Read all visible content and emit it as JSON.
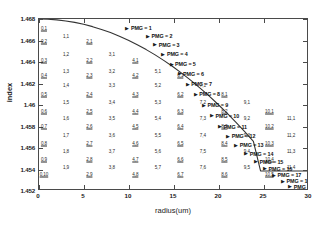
{
  "chart_data": {
    "type": "line",
    "title": "",
    "xlabel": "radius(um)",
    "ylabel": "index",
    "xlim": [
      0,
      30
    ],
    "ylim": [
      1.452,
      1.468
    ],
    "xticks": [
      "0",
      "5",
      "10",
      "15",
      "20",
      "25",
      "30"
    ],
    "xtick_values": [
      0,
      5,
      10,
      15,
      20,
      25,
      30
    ],
    "yticks": [
      "1.468",
      "1.466",
      "1.464",
      "1.462",
      "1.46",
      "1.458",
      "1.456",
      "1.454",
      "1.452"
    ],
    "ytick_values": [
      1.468,
      1.466,
      1.464,
      1.462,
      1.46,
      1.458,
      1.456,
      1.454,
      1.452
    ],
    "grid": false,
    "legend": "none",
    "series": [
      {
        "name": "refractive index profile",
        "color": "#333333",
        "x": [
          0,
          1,
          2,
          3,
          4,
          5,
          6,
          7,
          8,
          9,
          10,
          11,
          12,
          13,
          14,
          15,
          16,
          17,
          18,
          19,
          20,
          21,
          22,
          23,
          24,
          24.8,
          25,
          26,
          27,
          28,
          29,
          30
        ],
        "y": [
          1.468,
          1.46798,
          1.46792,
          1.46782,
          1.46768,
          1.4675,
          1.46728,
          1.46702,
          1.46672,
          1.46638,
          1.466,
          1.46558,
          1.46512,
          1.46462,
          1.46408,
          1.4635,
          1.46288,
          1.46222,
          1.46152,
          1.46078,
          1.46,
          1.45918,
          1.45832,
          1.45742,
          1.45648,
          1.4537,
          1.4537,
          1.4537,
          1.4537,
          1.4537,
          1.4537,
          1.4537
        ]
      }
    ],
    "mode_labels": [
      {
        "text": "0,1",
        "x": 0.55,
        "y": 1.46715,
        "underline": true
      },
      {
        "text": "0,2",
        "x": 0.55,
        "y": 1.46595,
        "underline": true
      },
      {
        "text": "0,3",
        "x": 0.55,
        "y": 1.46415,
        "underline": true
      },
      {
        "text": "0,4",
        "x": 0.55,
        "y": 1.46275,
        "underline": true
      },
      {
        "text": "0,5",
        "x": 0.55,
        "y": 1.46105,
        "underline": true
      },
      {
        "text": "0,6",
        "x": 0.55,
        "y": 1.45945,
        "underline": true
      },
      {
        "text": "0,7",
        "x": 0.55,
        "y": 1.45805,
        "underline": true
      },
      {
        "text": "0,8",
        "x": 0.55,
        "y": 1.4565,
        "underline": true
      },
      {
        "text": "0,9",
        "x": 0.55,
        "y": 1.45495,
        "underline": true
      },
      {
        "text": "0,10",
        "x": 0.55,
        "y": 1.45355,
        "underline": true
      },
      {
        "text": "1,1",
        "x": 3.0,
        "y": 1.4664,
        "underline": false
      },
      {
        "text": "1,2",
        "x": 3.0,
        "y": 1.4647,
        "underline": false
      },
      {
        "text": "1,3",
        "x": 3.0,
        "y": 1.4632,
        "underline": false
      },
      {
        "text": "1,4",
        "x": 3.0,
        "y": 1.46185,
        "underline": false
      },
      {
        "text": "1,5",
        "x": 3.0,
        "y": 1.4603,
        "underline": false
      },
      {
        "text": "1,6",
        "x": 3.0,
        "y": 1.45875,
        "underline": false
      },
      {
        "text": "1,7",
        "x": 3.0,
        "y": 1.4572,
        "underline": false
      },
      {
        "text": "1,8",
        "x": 3.0,
        "y": 1.4557,
        "underline": false
      },
      {
        "text": "1,9",
        "x": 3.0,
        "y": 1.4542,
        "underline": false
      },
      {
        "text": "2,1",
        "x": 5.6,
        "y": 1.46595,
        "underline": true
      },
      {
        "text": "2,2",
        "x": 5.6,
        "y": 1.46415,
        "underline": true
      },
      {
        "text": "2,3",
        "x": 5.6,
        "y": 1.46275,
        "underline": true
      },
      {
        "text": "2,4",
        "x": 5.6,
        "y": 1.46105,
        "underline": true
      },
      {
        "text": "2,5",
        "x": 5.6,
        "y": 1.45945,
        "underline": true
      },
      {
        "text": "2,6",
        "x": 5.6,
        "y": 1.45805,
        "underline": true
      },
      {
        "text": "2,7",
        "x": 5.6,
        "y": 1.4565,
        "underline": true
      },
      {
        "text": "2,8",
        "x": 5.6,
        "y": 1.45495,
        "underline": true
      },
      {
        "text": "2,9",
        "x": 5.6,
        "y": 1.45355,
        "underline": true
      },
      {
        "text": "3,1",
        "x": 8.1,
        "y": 1.4647,
        "underline": false
      },
      {
        "text": "3,2",
        "x": 8.1,
        "y": 1.4632,
        "underline": false
      },
      {
        "text": "3,3",
        "x": 8.1,
        "y": 1.46185,
        "underline": false
      },
      {
        "text": "3,4",
        "x": 8.1,
        "y": 1.4603,
        "underline": false
      },
      {
        "text": "3,5",
        "x": 8.1,
        "y": 1.45875,
        "underline": false
      },
      {
        "text": "3,6",
        "x": 8.1,
        "y": 1.4572,
        "underline": false
      },
      {
        "text": "3,7",
        "x": 8.1,
        "y": 1.4557,
        "underline": false
      },
      {
        "text": "3,8",
        "x": 8.1,
        "y": 1.4542,
        "underline": false
      },
      {
        "text": "4,1",
        "x": 10.7,
        "y": 1.46415,
        "underline": true
      },
      {
        "text": "4,2",
        "x": 10.7,
        "y": 1.46275,
        "underline": true
      },
      {
        "text": "4,3",
        "x": 10.7,
        "y": 1.46105,
        "underline": true
      },
      {
        "text": "4,4",
        "x": 10.7,
        "y": 1.45945,
        "underline": true
      },
      {
        "text": "4,5",
        "x": 10.7,
        "y": 1.45805,
        "underline": true
      },
      {
        "text": "4,6",
        "x": 10.7,
        "y": 1.4565,
        "underline": true
      },
      {
        "text": "4,7",
        "x": 10.7,
        "y": 1.45495,
        "underline": true
      },
      {
        "text": "4,8",
        "x": 10.7,
        "y": 1.45355,
        "underline": true
      },
      {
        "text": "5,1",
        "x": 13.2,
        "y": 1.4632,
        "underline": false
      },
      {
        "text": "5,2",
        "x": 13.2,
        "y": 1.46185,
        "underline": false
      },
      {
        "text": "5,3",
        "x": 13.2,
        "y": 1.4603,
        "underline": false
      },
      {
        "text": "5,4",
        "x": 13.2,
        "y": 1.45875,
        "underline": false
      },
      {
        "text": "5,5",
        "x": 13.2,
        "y": 1.4572,
        "underline": false
      },
      {
        "text": "5,6",
        "x": 13.2,
        "y": 1.4557,
        "underline": false
      },
      {
        "text": "5,7",
        "x": 13.2,
        "y": 1.4542,
        "underline": false
      },
      {
        "text": "6,1",
        "x": 15.7,
        "y": 1.46275,
        "underline": true
      },
      {
        "text": "6,2",
        "x": 15.7,
        "y": 1.46105,
        "underline": true
      },
      {
        "text": "6,3",
        "x": 15.7,
        "y": 1.45945,
        "underline": true
      },
      {
        "text": "6,4",
        "x": 15.7,
        "y": 1.45805,
        "underline": true
      },
      {
        "text": "6,5",
        "x": 15.7,
        "y": 1.4565,
        "underline": true
      },
      {
        "text": "6,6",
        "x": 15.7,
        "y": 1.45495,
        "underline": true
      },
      {
        "text": "6,7",
        "x": 15.7,
        "y": 1.45355,
        "underline": true
      },
      {
        "text": "7,1",
        "x": 18.2,
        "y": 1.46185,
        "underline": false
      },
      {
        "text": "7,2",
        "x": 18.2,
        "y": 1.4603,
        "underline": false
      },
      {
        "text": "7,3",
        "x": 18.2,
        "y": 1.45875,
        "underline": false
      },
      {
        "text": "7,4",
        "x": 18.2,
        "y": 1.4572,
        "underline": false
      },
      {
        "text": "7,5",
        "x": 18.2,
        "y": 1.4557,
        "underline": false
      },
      {
        "text": "7,6",
        "x": 18.2,
        "y": 1.4542,
        "underline": false
      },
      {
        "text": "8,1",
        "x": 20.6,
        "y": 1.46105,
        "underline": true
      },
      {
        "text": "8,2",
        "x": 20.6,
        "y": 1.45945,
        "underline": true
      },
      {
        "text": "8,3",
        "x": 20.6,
        "y": 1.45805,
        "underline": true
      },
      {
        "text": "8,4",
        "x": 20.6,
        "y": 1.4565,
        "underline": true
      },
      {
        "text": "8,5",
        "x": 20.6,
        "y": 1.45495,
        "underline": true
      },
      {
        "text": "8,6",
        "x": 20.6,
        "y": 1.45355,
        "underline": true
      },
      {
        "text": "9,1",
        "x": 23.1,
        "y": 1.4603,
        "underline": false
      },
      {
        "text": "9,2",
        "x": 23.1,
        "y": 1.45875,
        "underline": false
      },
      {
        "text": "9,3",
        "x": 23.1,
        "y": 1.4572,
        "underline": false
      },
      {
        "text": "9,4",
        "x": 23.1,
        "y": 1.4557,
        "underline": false
      },
      {
        "text": "9,5",
        "x": 23.1,
        "y": 1.4542,
        "underline": false
      },
      {
        "text": "10,1",
        "x": 25.6,
        "y": 1.45945,
        "underline": true
      },
      {
        "text": "10,2",
        "x": 25.6,
        "y": 1.45805,
        "underline": true
      },
      {
        "text": "10,3",
        "x": 25.6,
        "y": 1.4565,
        "underline": true
      },
      {
        "text": "10,4",
        "x": 25.6,
        "y": 1.45495,
        "underline": true
      },
      {
        "text": "10,5",
        "x": 25.6,
        "y": 1.45355,
        "underline": true
      },
      {
        "text": "11,1",
        "x": 28.0,
        "y": 1.45875,
        "underline": false
      },
      {
        "text": "11,2",
        "x": 28.0,
        "y": 1.4572,
        "underline": false
      },
      {
        "text": "11,3",
        "x": 28.0,
        "y": 1.4557,
        "underline": false
      },
      {
        "text": "11,4",
        "x": 28.0,
        "y": 1.4542,
        "underline": false
      }
    ],
    "pmg_annotations": [
      {
        "label": "PMG = 1",
        "x": 9.6,
        "y": 1.46715
      },
      {
        "label": "PMG = 2",
        "x": 11.9,
        "y": 1.4664
      },
      {
        "label": "PMG = 3",
        "x": 12.7,
        "y": 1.4656
      },
      {
        "label": "PMG = 4",
        "x": 13.6,
        "y": 1.4647
      },
      {
        "label": "PMG = 5",
        "x": 14.5,
        "y": 1.4638
      },
      {
        "label": "PMG = 6",
        "x": 15.4,
        "y": 1.4629
      },
      {
        "label": "PMG = 7",
        "x": 16.3,
        "y": 1.46195
      },
      {
        "label": "PMG = 8",
        "x": 17.2,
        "y": 1.461
      },
      {
        "label": "PMG = 9",
        "x": 18.1,
        "y": 1.46
      },
      {
        "label": "PMG = 10",
        "x": 19.0,
        "y": 1.459
      },
      {
        "label": "PMG = 11",
        "x": 19.9,
        "y": 1.458
      },
      {
        "label": "PMG = 12",
        "x": 20.8,
        "y": 1.4571
      },
      {
        "label": "PMG = 13",
        "x": 21.7,
        "y": 1.45625
      },
      {
        "label": "PMG = 14",
        "x": 22.8,
        "y": 1.45545
      },
      {
        "label": "PMG = 15",
        "x": 23.9,
        "y": 1.4547
      },
      {
        "label": "PMG = 16",
        "x": 24.9,
        "y": 1.45405
      },
      {
        "label": "PMG = 17",
        "x": 25.9,
        "y": 1.45345
      },
      {
        "label": "PMG = 18",
        "x": 26.9,
        "y": 1.4529
      },
      {
        "label": "PMG = 19",
        "x": 27.7,
        "y": 1.4524
      }
    ]
  }
}
